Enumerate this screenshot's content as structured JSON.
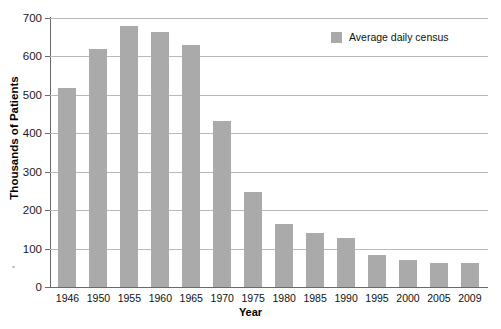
{
  "chart_data": {
    "type": "bar",
    "title": "",
    "xlabel": "Year",
    "ylabel": "Thousands of Patients",
    "categories": [
      "1946",
      "1950",
      "1955",
      "1960",
      "1965",
      "1970",
      "1975",
      "1980",
      "1985",
      "1990",
      "1995",
      "2000",
      "2005",
      "2009"
    ],
    "series": [
      {
        "name": "Average daily census",
        "values": [
          518,
          619,
          678,
          664,
          631,
          432,
          248,
          163,
          140,
          128,
          84,
          70,
          62,
          63
        ],
        "color": "#aaaaaa"
      }
    ],
    "ylim": [
      0,
      700
    ],
    "yticks": [
      0,
      100,
      200,
      300,
      400,
      500,
      600,
      700
    ],
    "ytick_labels": [
      "0",
      "100",
      "200",
      "300",
      "400",
      "500",
      "600",
      "700"
    ],
    "grid": "horizontal",
    "legend_position": "top-right",
    "legend_entries": [
      "Average daily census"
    ],
    "axis_color": "#6a6a6a",
    "grid_color": "#b9b9b9",
    "background": "#ffffff"
  }
}
